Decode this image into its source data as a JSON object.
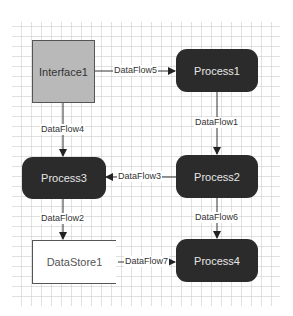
{
  "diagram": {
    "type": "data-flow-diagram",
    "nodes": {
      "interface1": {
        "label": "Interface1",
        "kind": "interface"
      },
      "process1": {
        "label": "Process1",
        "kind": "process"
      },
      "process2": {
        "label": "Process2",
        "kind": "process"
      },
      "process3": {
        "label": "Process3",
        "kind": "process"
      },
      "process4": {
        "label": "Process4",
        "kind": "process"
      },
      "datastore1": {
        "label": "DataStore1",
        "kind": "datastore"
      }
    },
    "flows": {
      "df1": {
        "label": "DataFlow1",
        "from": "Process1",
        "to": "Process2"
      },
      "df2": {
        "label": "DataFlow2",
        "from": "Process3",
        "to": "DataStore1"
      },
      "df3": {
        "label": "DataFlow3",
        "from": "Process2",
        "to": "Process3"
      },
      "df4": {
        "label": "DataFlow4",
        "from": "Interface1",
        "to": "Process3"
      },
      "df5": {
        "label": "DataFlow5",
        "from": "Interface1",
        "to": "Process1"
      },
      "df6": {
        "label": "DataFlow6",
        "from": "Process2",
        "to": "Process4"
      },
      "df7": {
        "label": "DataFlow7",
        "from": "DataStore1",
        "to": "Process4"
      }
    },
    "colors": {
      "process_fill": "#2b2b2b",
      "interface_fill": "#b9b9b9",
      "grid": "#c8c8c8"
    }
  }
}
